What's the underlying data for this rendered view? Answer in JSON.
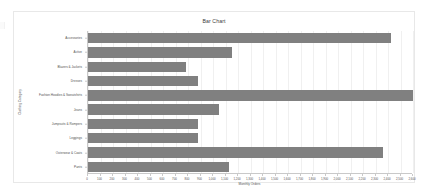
{
  "chart_data": {
    "type": "bar",
    "orientation": "horizontal",
    "title": "Bar Chart",
    "xlabel": "Monthly Orders",
    "ylabel": "Clothing Category",
    "categories": [
      "Accessories",
      "Active",
      "Blazers & Jackets",
      "Dresses",
      "Fashion Hoodies & Sweatshirts",
      "Jeans",
      "Jumpsuits & Rompers",
      "Leggings",
      "Outerwear & Coats",
      "Pants"
    ],
    "values": [
      2420,
      1150,
      780,
      880,
      2600,
      1050,
      880,
      880,
      2360,
      1130
    ],
    "xlim": [
      0,
      2600
    ],
    "ylim": null,
    "xticks": [
      0,
      100,
      200,
      300,
      400,
      500,
      600,
      700,
      800,
      900,
      1000,
      1100,
      1200,
      1300,
      1400,
      1500,
      1600,
      1700,
      1800,
      1900,
      2000,
      2100,
      2200,
      2300,
      2400,
      2500,
      2600
    ],
    "xticklabels": [
      "0",
      "100",
      "200",
      "300",
      "400",
      "500",
      "600",
      "700",
      "800",
      "900",
      "1,000",
      "1,100",
      "1,200",
      "1,300",
      "1,400",
      "1,500",
      "1,600",
      "1,700",
      "1,800",
      "1,900",
      "2,000",
      "2,100",
      "2,200",
      "2,300",
      "2,400",
      "2,500",
      "2,600"
    ],
    "grid": true,
    "legend": null,
    "bar_color": "#808080",
    "background_color": "#ffffff"
  }
}
